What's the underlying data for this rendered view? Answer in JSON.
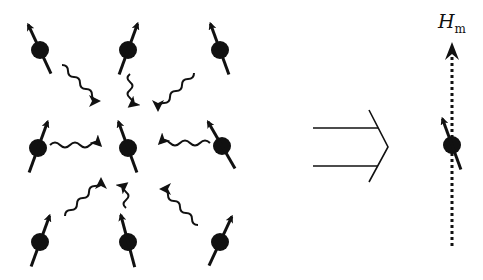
{
  "figure": {
    "field_label": {
      "main": "H",
      "subscript": "m"
    },
    "colors": {
      "ink": "#111111",
      "background": "#ffffff"
    },
    "left_panel": {
      "spins": [
        {
          "x": 40,
          "y": 50,
          "angle": -25
        },
        {
          "x": 128,
          "y": 50,
          "angle": 20
        },
        {
          "x": 220,
          "y": 50,
          "angle": -20
        },
        {
          "x": 38,
          "y": 148,
          "angle": 20
        },
        {
          "x": 128,
          "y": 148,
          "angle": -20
        },
        {
          "x": 222,
          "y": 146,
          "angle": -30
        },
        {
          "x": 40,
          "y": 242,
          "angle": 20
        },
        {
          "x": 128,
          "y": 242,
          "angle": -15
        },
        {
          "x": 220,
          "y": 242,
          "angle": 25
        }
      ],
      "interaction_arrows": 8
    },
    "implication_symbol": "double-arrow-implies",
    "right_panel": {
      "spin": {
        "x": 452,
        "y": 145,
        "angle": -20
      },
      "field_line": "dotted-vertical"
    }
  }
}
